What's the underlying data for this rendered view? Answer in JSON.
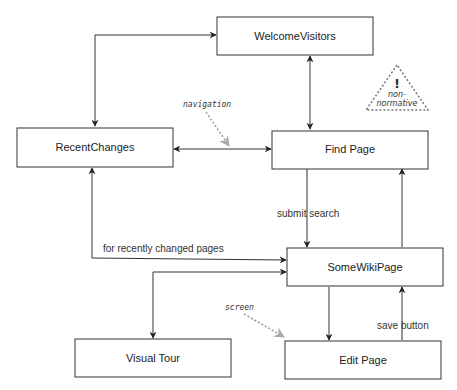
{
  "diagram": {
    "nodes": {
      "welcome": "WelcomeVisitors",
      "recent": "RecentChanges",
      "find": "Find Page",
      "somewiki": "SomeWikiPage",
      "tour": "Visual Tour",
      "edit": "Edit Page"
    },
    "edge_labels": {
      "submit_search": "submit search",
      "recently_changed": "for recently changed pages",
      "save_button": "save button"
    },
    "annotations": {
      "navigation": "navigation",
      "screen": "screen",
      "warning_mark": "!",
      "warning_line1": "non-",
      "warning_line2": "normative"
    },
    "edges": [
      {
        "from": "RecentChanges",
        "to": "WelcomeVisitors",
        "direction": "both"
      },
      {
        "from": "WelcomeVisitors",
        "to": "Find Page",
        "direction": "both"
      },
      {
        "from": "RecentChanges",
        "to": "Find Page",
        "direction": "both"
      },
      {
        "from": "Find Page",
        "to": "SomeWikiPage",
        "label": "submit search",
        "direction": "forward"
      },
      {
        "from": "SomeWikiPage",
        "to": "Find Page",
        "direction": "forward"
      },
      {
        "from": "RecentChanges",
        "to": "SomeWikiPage",
        "label": "for recently changed pages",
        "direction": "both"
      },
      {
        "from": "SomeWikiPage",
        "to": "Visual Tour",
        "direction": "both"
      },
      {
        "from": "SomeWikiPage",
        "to": "Edit Page",
        "direction": "forward"
      },
      {
        "from": "Edit Page",
        "to": "SomeWikiPage",
        "label": "save button",
        "direction": "forward"
      }
    ]
  }
}
